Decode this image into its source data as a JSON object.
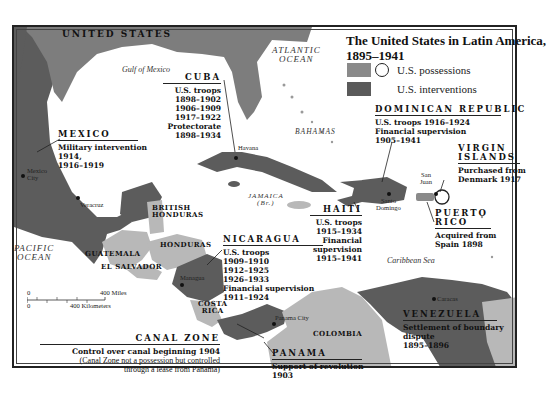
{
  "title": {
    "line1": "The United States in Latin America,",
    "line2": "1895–1941"
  },
  "legend": {
    "items": [
      {
        "label": "U.S. possessions",
        "color": "#8a8a8a",
        "symbol": "circle-outline"
      },
      {
        "label": "U.S. interventions",
        "color": "#5a5a5a"
      }
    ]
  },
  "colors": {
    "us_possession": "#8a8a8a",
    "us_intervention": "#5c5c5c",
    "other_land": "#b8b8b8",
    "us_mainland": "#7d7d7d",
    "water": "#ffffff"
  },
  "regions": {
    "united_states": "UNITED STATES",
    "gulf": "Gulf of Mexico",
    "atlantic": [
      "ATLANTIC",
      "OCEAN"
    ],
    "pacific": [
      "PACIFIC",
      "OCEAN"
    ],
    "caribbean": "Caribbean Sea",
    "bahamas": "BAHAMAS",
    "jamaica": [
      "JAMAICA",
      "(Br.)"
    ],
    "british_honduras": [
      "BRITISH",
      "HONDURAS"
    ],
    "guatemala": "GUATEMALA",
    "el_salvador": "EL SALVADOR",
    "honduras": "HONDURAS",
    "costa_rica": [
      "COSTA",
      "RICA"
    ],
    "colombia": "COLOMBIA"
  },
  "cities": {
    "havana": "Havana",
    "mexico_city": [
      "Mexico",
      "City"
    ],
    "veracruz": "Veracruz",
    "managua": "Managua",
    "panama_city": "Panama City",
    "santo_domingo": [
      "Santo",
      "Domingo"
    ],
    "san_juan": [
      "San",
      "Juan"
    ],
    "caracas": "Caracas"
  },
  "annotations": {
    "cuba": {
      "name": "CUBA",
      "lines": [
        "U.S. troops",
        "1898–1902",
        "1906–1909",
        "1917–1922",
        "Protectorate",
        "1898–1934"
      ]
    },
    "mexico": {
      "name": "MEXICO",
      "lines": [
        "Military intervention",
        "1914,",
        "1916–1919"
      ]
    },
    "dominican_republic": {
      "name": "DOMINICAN REPUBLIC",
      "lines": [
        "U.S. troops 1916–1924",
        "Financial supervision",
        "1905–1941"
      ]
    },
    "virgin_islands": {
      "name": [
        "VIRGIN",
        "ISLANDS"
      ],
      "lines": [
        "Purchased from",
        "Denmark 1917"
      ]
    },
    "haiti": {
      "name": "HAITI",
      "lines": [
        "U.S. troops",
        "1915–1934",
        "Financial",
        "supervision",
        "1915–1941"
      ]
    },
    "puerto_rico": {
      "name": [
        "PUERTO",
        "RICO"
      ],
      "lines": [
        "Acquired from",
        "Spain 1898"
      ]
    },
    "nicaragua": {
      "name": "NICARAGUA",
      "lines": [
        "U.S. troops",
        "1909–1910",
        "1912–1925",
        "1926–1933",
        "Financial supervision",
        "1911–1924"
      ]
    },
    "canal_zone": {
      "name": "CANAL ZONE",
      "lines": [
        "Control over canal beginning 1904",
        "(Canal Zone not a possession but controlled",
        "through a lease from Panama)"
      ]
    },
    "panama": {
      "name": "PANAMA",
      "lines": [
        "Support of revolution",
        "1903"
      ]
    },
    "venezuela": {
      "name": "VENEZUELA",
      "lines": [
        "Settlement of boundary",
        "dispute",
        "1895–1896"
      ]
    }
  },
  "scale": {
    "miles_zero": "0",
    "miles_label": "400 Miles",
    "km_zero": "0",
    "km_label": "400 Kilometers"
  }
}
